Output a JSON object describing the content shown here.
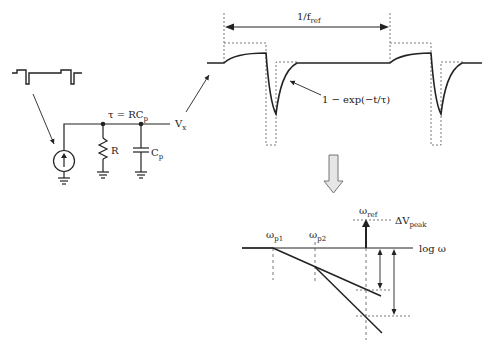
{
  "circuit": {
    "tau_label": "τ = RC",
    "tau_sub": "p",
    "resistor_label": "R",
    "capacitor_label": "C",
    "capacitor_sub": "p",
    "output_label": "V",
    "output_sub": "x"
  },
  "waveform": {
    "period_label": "1/f",
    "period_sub": "ref",
    "curve_label": "1 − exp(−t/τ)"
  },
  "bode": {
    "pole1_label": "ω",
    "pole1_sub": "p1",
    "pole2_label": "ω",
    "pole2_sub": "p2",
    "ref_label": "ω",
    "ref_sub": "ref",
    "peak_label": "ΔV",
    "peak_sub": "peak",
    "axis_label": "log ω"
  },
  "colors": {
    "line": "#222222",
    "dashed": "#555555",
    "arrow_fill": "#e6e6e6",
    "arrow_stroke": "#666666"
  }
}
